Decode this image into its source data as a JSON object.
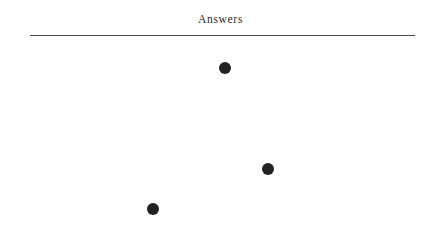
{
  "document": {
    "title": "Answers",
    "background_color": "#ffffff",
    "rule": {
      "color": "#4a4a4a",
      "left": 30,
      "right": 415,
      "y": 35,
      "thickness": 1
    }
  },
  "chart_data": {
    "type": "scatter",
    "title": "Answers",
    "xlabel": "",
    "ylabel": "",
    "grid": false,
    "legend": null,
    "axis_visible": false,
    "tick_labels": [],
    "marker": {
      "shape": "circle",
      "color": "#222222",
      "diameter_px": 12
    },
    "xlim": [
      0,
      441
    ],
    "ylim": [
      227,
      0
    ],
    "points": [
      {
        "label": "",
        "x": 225,
        "y": 68
      },
      {
        "label": "",
        "x": 268,
        "y": 169
      },
      {
        "label": "",
        "x": 153,
        "y": 209
      }
    ]
  }
}
